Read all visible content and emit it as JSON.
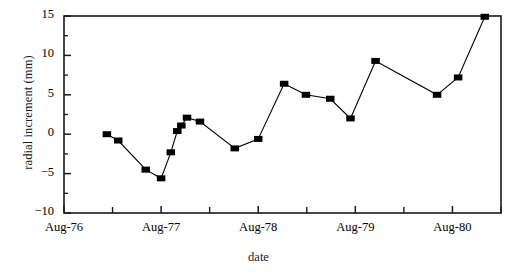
{
  "chart_data": {
    "type": "line",
    "title": "",
    "xlabel": "date",
    "ylabel": "radial increment (mm)",
    "ylim": [
      -10,
      15
    ],
    "ytick_labels": [
      "15",
      "10",
      "5",
      "0",
      "-5",
      "-10"
    ],
    "ytick_values": [
      15,
      10,
      5,
      0,
      -5,
      -10
    ],
    "yminor_values": [
      12.5,
      7.5,
      2.5,
      -2.5,
      -7.5
    ],
    "xtick_labels": [
      "Aug-76",
      "Aug-77",
      "Aug-78",
      "Aug-79",
      "Aug-80"
    ],
    "xtick_values": [
      0,
      12,
      24,
      36,
      48
    ],
    "xminor_values": [
      6,
      18,
      30,
      42,
      54
    ],
    "xlim": [
      0,
      54
    ],
    "grid": false,
    "legend": null,
    "marker": "filled-square",
    "line_color": "#000000",
    "marker_color": "#000000",
    "x": [
      5.3,
      6.7,
      10.1,
      12.0,
      13.2,
      14.0,
      14.5,
      15.2,
      16.8,
      21.1,
      24.0,
      27.2,
      29.9,
      32.9,
      35.4,
      38.5,
      46.1,
      48.7,
      52.0
    ],
    "x_date_labels": [
      "Jan-77",
      "Mar-77",
      "Jun-77",
      "Aug-77",
      "Sep-77",
      "Oct-77",
      "Nov-77",
      "Nov-77",
      "Jan-78",
      "May-78",
      "Aug-78",
      "Nov-78",
      "Feb-79",
      "May-79",
      "Jul-79",
      "Oct-79",
      "Jun-80",
      "Aug-80",
      "Dec-80"
    ],
    "values": [
      0.0,
      -0.8,
      -4.5,
      -5.6,
      -2.3,
      0.4,
      1.1,
      2.1,
      1.6,
      -1.8,
      -0.6,
      6.4,
      5.0,
      4.5,
      2.0,
      9.3,
      5.0,
      7.2,
      14.9
    ],
    "series": [
      {
        "name": "radial increment",
        "values": [
          0.0,
          -0.8,
          -4.5,
          -5.6,
          -2.3,
          0.4,
          1.1,
          2.1,
          1.6,
          -1.8,
          -0.6,
          6.4,
          5.0,
          4.5,
          2.0,
          9.3,
          5.0,
          7.2,
          14.9
        ]
      }
    ]
  }
}
